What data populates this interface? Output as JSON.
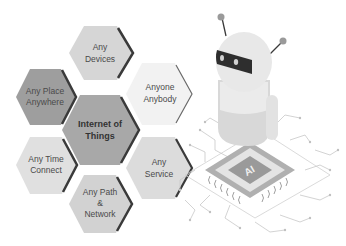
{
  "diagram": {
    "title": "Internet of Things",
    "center": {
      "label_lines": [
        "Internet of",
        "Things"
      ],
      "fill": "#a8a8a8"
    },
    "nodes": [
      {
        "id": "devices",
        "label_lines": [
          "Any",
          "Devices"
        ],
        "fill": "#d6d6d6"
      },
      {
        "id": "place",
        "label_lines": [
          "Any Place",
          "Anywhere"
        ],
        "fill": "#9e9e9e"
      },
      {
        "id": "anyone",
        "label_lines": [
          "Anyone",
          "Anybody"
        ],
        "fill": "#f2f2f2"
      },
      {
        "id": "time",
        "label_lines": [
          "Any Time",
          "Connect"
        ],
        "fill": "#e0e0e0"
      },
      {
        "id": "service",
        "label_lines": [
          "Any",
          "Service"
        ],
        "fill": "#dcdcdc"
      },
      {
        "id": "path",
        "label_lines": [
          "Any Path",
          "&",
          "Network"
        ],
        "fill": "#d2d2d2"
      }
    ],
    "illustration": {
      "chip_label": "AI",
      "subject": "robot-on-circuit-chip"
    }
  },
  "colors": {
    "edge_shadow": "#3a3a3a",
    "robot_body": "#e6e6e6",
    "robot_visor": "#2e2e2e",
    "circuit_lines": "#c8c8c8",
    "chip_outer": "#b0b0b0",
    "chip_inner": "#9a9a9a"
  }
}
